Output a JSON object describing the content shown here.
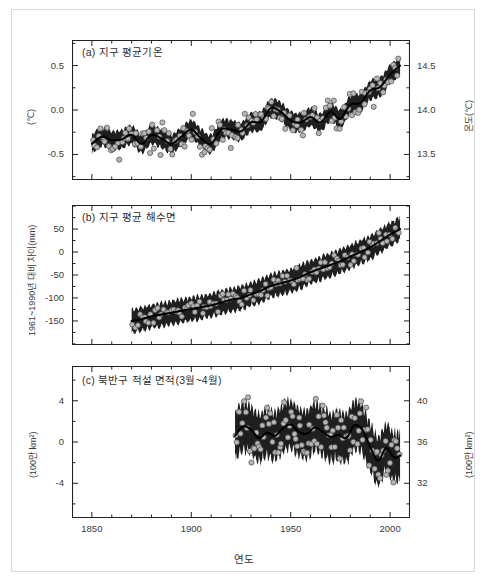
{
  "figure": {
    "xaxis_title": "연도",
    "xaxis_ticks": [
      "1850",
      "1900",
      "1950",
      "2000"
    ],
    "xaxis_tick_values": [
      1850,
      1900,
      1950,
      2000
    ],
    "xlim": [
      1840,
      2010
    ]
  },
  "panels": {
    "a": {
      "title": "(a) 지구 평균기온",
      "left_axis_label": "(℃)",
      "right_axis_label": "온도(℃)",
      "left_ticks": [
        "0.5",
        "0.0",
        "-0.5"
      ],
      "left_tick_values": [
        0.5,
        0.0,
        -0.5
      ],
      "right_ticks": [
        "14.5",
        "14.0",
        "13.5"
      ],
      "right_tick_values": [
        14.5,
        14.0,
        13.5
      ],
      "ylim": [
        -0.72,
        0.72
      ]
    },
    "b": {
      "title": "(b) 지구 평균 해수면",
      "left_axis_label": "1961~1990년 대비 차이(mm)",
      "right_axis_label": "",
      "left_ticks": [
        "50",
        "0",
        "-50",
        "-100",
        "-150"
      ],
      "left_tick_values": [
        50,
        0,
        -50,
        -100,
        -150
      ],
      "ylim": [
        -185,
        85
      ]
    },
    "c": {
      "title": "(c) 북반구 적설 면적(3월~4월)",
      "left_axis_label": "(100만 km²)",
      "right_axis_label": "(100만 km²)",
      "left_ticks": [
        "4",
        "0",
        "-4"
      ],
      "left_tick_values": [
        4,
        0,
        -4
      ],
      "right_ticks": [
        "40",
        "36",
        "32"
      ],
      "right_tick_values": [
        40,
        36,
        32
      ],
      "ylim": [
        -6.4,
        6.4
      ]
    }
  },
  "chart_data": {
    "type": "line",
    "xlabel": "연도",
    "subcharts": [
      {
        "id": "a",
        "title": "(a) 지구 평균기온",
        "ylabel": "(℃)",
        "ylabel_right": "온도(℃)",
        "ylim": [
          -0.72,
          0.72
        ],
        "ylim_right": [
          13.28,
          14.72
        ],
        "xlim": [
          1850,
          2005
        ],
        "series": [
          {
            "name": "평활 곡선 (smoothed)",
            "x": [
              1850,
              1855,
              1860,
              1865,
              1870,
              1875,
              1880,
              1885,
              1890,
              1895,
              1900,
              1905,
              1910,
              1915,
              1920,
              1925,
              1930,
              1935,
              1940,
              1945,
              1950,
              1955,
              1960,
              1965,
              1970,
              1975,
              1980,
              1985,
              1990,
              1995,
              2000,
              2005
            ],
            "values": [
              -0.38,
              -0.3,
              -0.34,
              -0.33,
              -0.28,
              -0.38,
              -0.28,
              -0.32,
              -0.38,
              -0.3,
              -0.22,
              -0.32,
              -0.38,
              -0.22,
              -0.22,
              -0.24,
              -0.14,
              -0.13,
              0.02,
              -0.02,
              -0.12,
              -0.14,
              -0.08,
              -0.14,
              -0.02,
              -0.1,
              0.06,
              0.08,
              0.22,
              0.26,
              0.4,
              0.5
            ]
          },
          {
            "name": "불확실성 범위 (uncertainty band)",
            "band_halfwidth": 0.09
          },
          {
            "name": "연간 관측값 (annual observations)",
            "marker": "open-circle"
          }
        ]
      },
      {
        "id": "b",
        "title": "(b) 지구 평균 해수면",
        "ylabel": "1961~1990년 대비 차이(mm)",
        "ylim": [
          -185,
          85
        ],
        "xlim": [
          1870,
          2005
        ],
        "series": [
          {
            "name": "평활 곡선 (smoothed)",
            "x": [
              1870,
              1875,
              1880,
              1885,
              1890,
              1895,
              1900,
              1905,
              1910,
              1915,
              1920,
              1925,
              1930,
              1935,
              1940,
              1945,
              1950,
              1955,
              1960,
              1965,
              1970,
              1975,
              1980,
              1985,
              1990,
              1995,
              2000,
              2005
            ],
            "values": [
              -150,
              -146,
              -140,
              -136,
              -132,
              -128,
              -124,
              -120,
              -116,
              -110,
              -104,
              -100,
              -92,
              -84,
              -74,
              -68,
              -62,
              -54,
              -44,
              -36,
              -28,
              -20,
              -10,
              0,
              10,
              24,
              38,
              50
            ]
          },
          {
            "name": "불확실성 범위 (uncertainty band)",
            "band_halfwidth": 22
          },
          {
            "name": "연간 관측값 (annual observations)",
            "marker": "open-circle"
          }
        ]
      },
      {
        "id": "c",
        "title": "(c) 북반구 적설 면적(3월~4월)",
        "ylabel": "(100만 km²)",
        "ylabel_right": "(100만 km²)",
        "ylim": [
          -6.4,
          6.4
        ],
        "ylim_right": [
          29.6,
          42.4
        ],
        "xlim": [
          1922,
          2005
        ],
        "series": [
          {
            "name": "평활 곡선 (smoothed)",
            "x": [
              1922,
              1926,
              1930,
              1934,
              1938,
              1942,
              1946,
              1950,
              1954,
              1958,
              1962,
              1966,
              1970,
              1974,
              1978,
              1982,
              1986,
              1990,
              1994,
              1998,
              2002,
              2005
            ],
            "values": [
              0.6,
              1.5,
              1.2,
              0.4,
              0.9,
              0.6,
              1.3,
              1.7,
              1.0,
              0.8,
              1.4,
              1.0,
              0.5,
              0.7,
              0.4,
              1.6,
              1.2,
              -0.5,
              -1.8,
              -0.6,
              -1.5,
              -1.3
            ]
          },
          {
            "name": "불확실성 범위 (uncertainty band)",
            "band_halfwidth": 2.0
          },
          {
            "name": "연간 관측값 (annual observations)",
            "marker": "open-circle"
          }
        ]
      }
    ]
  }
}
